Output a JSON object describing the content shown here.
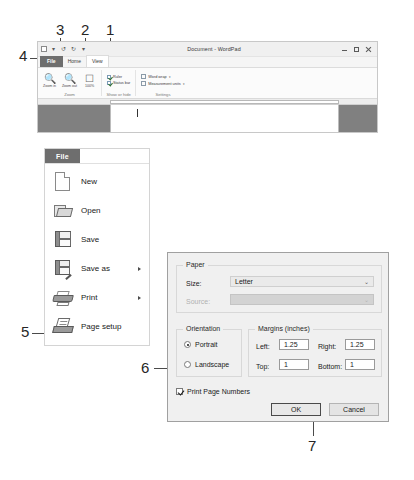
{
  "callouts": [
    {
      "id": "1",
      "label": "1"
    },
    {
      "id": "2",
      "label": "2"
    },
    {
      "id": "3",
      "label": "3"
    },
    {
      "id": "4",
      "label": "4"
    },
    {
      "id": "5",
      "label": "5"
    },
    {
      "id": "6",
      "label": "6"
    },
    {
      "id": "7",
      "label": "7"
    }
  ],
  "wordpad": {
    "title": "Document - WordPad",
    "window_buttons": {
      "minimize": "Minimize",
      "maximize": "Maximize",
      "close": "Close"
    },
    "tabs": [
      {
        "label": "File",
        "state": "file"
      },
      {
        "label": "Home",
        "state": "inactive"
      },
      {
        "label": "View",
        "state": "active"
      }
    ],
    "ribbon": {
      "groups": [
        {
          "label": "Zoom",
          "buttons": [
            {
              "icon": "zoom-in-icon",
              "caption": "Zoom in"
            },
            {
              "icon": "zoom-out-icon",
              "caption": "Zoom out"
            },
            {
              "icon": "zoom-100-icon",
              "caption": "100%"
            }
          ]
        },
        {
          "label": "Show or hide",
          "checkboxes": [
            {
              "label": "Ruler",
              "checked": true
            },
            {
              "label": "Status bar",
              "checked": true
            }
          ]
        },
        {
          "label": "Settings",
          "dropdowns": [
            {
              "label": "Word wrap",
              "caret": "▾"
            },
            {
              "label": "Measurement units",
              "caret": "▾"
            }
          ]
        }
      ]
    }
  },
  "file_menu": {
    "tab_label": "File",
    "items": [
      {
        "label": "New",
        "accel": "N",
        "icon": "new-document-icon",
        "submenu": false
      },
      {
        "label": "Open",
        "accel": "O",
        "icon": "open-folder-icon",
        "submenu": false
      },
      {
        "label": "Save",
        "accel": "a",
        "icon": "save-floppy-icon",
        "submenu": false
      },
      {
        "label": "Save as",
        "accel": "as",
        "icon": "save-as-icon",
        "submenu": true
      },
      {
        "label": "Print",
        "accel": "P",
        "icon": "printer-icon",
        "submenu": true
      },
      {
        "label": "Page setup",
        "accel": "",
        "icon": "page-setup-icon",
        "submenu": false
      }
    ]
  },
  "page_setup": {
    "paper": {
      "group_label": "Paper",
      "size_label": "Size:",
      "size_value": "Letter",
      "source_label": "Source:",
      "source_value": "",
      "caret": "⌄"
    },
    "orientation": {
      "group_label": "Orientation",
      "options": [
        {
          "label": "Portrait",
          "selected": true
        },
        {
          "label": "Landscape",
          "selected": false
        }
      ]
    },
    "margins": {
      "group_label": "Margins (inches)",
      "fields": [
        {
          "label": "Left:",
          "value": "1.25"
        },
        {
          "label": "Right:",
          "value": "1.25"
        },
        {
          "label": "Top:",
          "value": "1"
        },
        {
          "label": "Bottom:",
          "value": "1"
        }
      ]
    },
    "print_page_numbers": {
      "label": "Print Page Numbers",
      "checked": true
    },
    "buttons": [
      {
        "label": "OK",
        "default": true
      },
      {
        "label": "Cancel",
        "default": false
      }
    ]
  }
}
